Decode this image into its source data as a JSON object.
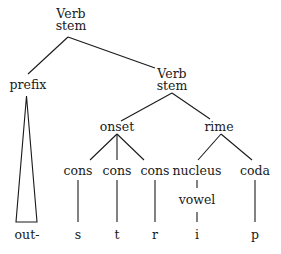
{
  "diagram": {
    "type": "syntax-tree",
    "nodes": {
      "root": {
        "line1": "Verb",
        "line2": "stem"
      },
      "prefix": {
        "label": "prefix"
      },
      "stem2": {
        "line1": "Verb",
        "line2": "stem"
      },
      "onset": {
        "label": "onset"
      },
      "rime": {
        "label": "rime"
      },
      "cons1": {
        "label": "cons"
      },
      "cons2": {
        "label": "cons"
      },
      "cons3": {
        "label": "cons"
      },
      "nucleus": {
        "label": "nucleus"
      },
      "coda": {
        "label": "coda"
      },
      "vowel": {
        "label": "vowel"
      },
      "leaf_out": {
        "label": "out-"
      },
      "leaf_s": {
        "label": "s"
      },
      "leaf_t": {
        "label": "t"
      },
      "leaf_r": {
        "label": "r"
      },
      "leaf_i": {
        "label": "i"
      },
      "leaf_p": {
        "label": "p"
      }
    },
    "edges": [
      [
        "root",
        "prefix"
      ],
      [
        "root",
        "stem2"
      ],
      [
        "prefix",
        "leaf_out (triangle)"
      ],
      [
        "stem2",
        "onset"
      ],
      [
        "stem2",
        "rime"
      ],
      [
        "onset",
        "cons1"
      ],
      [
        "onset",
        "cons2"
      ],
      [
        "onset",
        "cons3"
      ],
      [
        "rime",
        "nucleus"
      ],
      [
        "rime",
        "coda"
      ],
      [
        "cons1",
        "leaf_s"
      ],
      [
        "cons2",
        "leaf_t"
      ],
      [
        "cons3",
        "leaf_r"
      ],
      [
        "nucleus",
        "vowel"
      ],
      [
        "vowel",
        "leaf_i"
      ],
      [
        "coda",
        "leaf_p"
      ]
    ],
    "colors": {
      "line": "#1a1a1a",
      "text": "#1a1a1a",
      "background": "#ffffff"
    }
  }
}
